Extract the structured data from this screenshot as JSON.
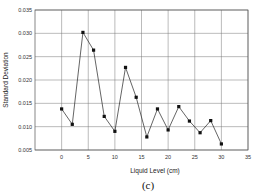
{
  "chart_data": {
    "type": "line",
    "title": "",
    "xlabel": "Liquid Level (cm)",
    "ylabel": "Standard Deviation",
    "caption": "(c)",
    "xlim": [
      -5,
      35
    ],
    "ylim": [
      0.005,
      0.035
    ],
    "x_ticks": [
      "0",
      "5",
      "10",
      "15",
      "20",
      "25",
      "30",
      "35"
    ],
    "y_ticks": [
      "0.005",
      "0.010",
      "0.015",
      "0.020",
      "0.025",
      "0.030",
      "0.035"
    ],
    "grid": true,
    "legend": null,
    "series": [
      {
        "name": "Standard Deviation",
        "marker": "square",
        "color": "#111111",
        "x": [
          0,
          2,
          4,
          6,
          8,
          10,
          12,
          14,
          16,
          18,
          20,
          22,
          24,
          26,
          28,
          30
        ],
        "values": [
          0.0138,
          0.0105,
          0.0302,
          0.0264,
          0.0122,
          0.009,
          0.0227,
          0.0163,
          0.0078,
          0.0138,
          0.0093,
          0.0143,
          0.0112,
          0.0087,
          0.0113,
          0.0063
        ]
      }
    ]
  }
}
